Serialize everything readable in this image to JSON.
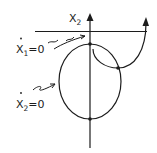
{
  "diagram": {
    "type": "phase-plane-sketch",
    "axis": {
      "label": "X",
      "label_subscript": "2"
    },
    "nullclines": [
      {
        "id": "x1-dot-zero",
        "label_var": "X",
        "label_subscript": "1",
        "label_eq": "=0",
        "shape": "horizontal line",
        "dotted": true
      },
      {
        "id": "x2-dot-zero",
        "label_var": "X",
        "label_subscript": "2",
        "label_eq": "=0",
        "shape": "ellipse",
        "dotted": true
      }
    ],
    "equilibria_count": 3,
    "trajectory": "curve from top of ellipse down through right intersection and up with arrow",
    "colors": {
      "ink": "#1c1c1c",
      "background": "#ffffff"
    }
  }
}
